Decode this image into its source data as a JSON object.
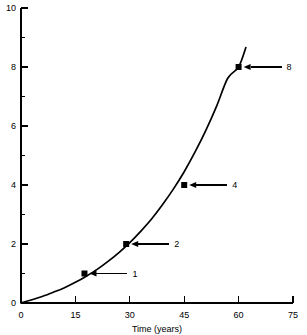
{
  "chart_data": {
    "type": "line",
    "title": "",
    "subtitle": "",
    "xlabel": "Time (years)",
    "ylabel": "",
    "xlim": [
      0,
      75
    ],
    "ylim": [
      0,
      10
    ],
    "grid": false,
    "legend": null,
    "x_ticks": [
      0,
      15,
      30,
      45,
      60,
      75
    ],
    "x_tick_labels": [
      "0",
      "15",
      "30",
      "45",
      "60",
      "75"
    ],
    "x_minor_ticks": [],
    "y_ticks": [
      0,
      2,
      4,
      6,
      8,
      10
    ],
    "y_tick_labels": [
      "0",
      "2",
      "4",
      "6",
      "8",
      "10"
    ],
    "y_minor_ticks": [
      1,
      3,
      5,
      7,
      9
    ],
    "series": [
      {
        "name": "exponential growth",
        "x": [
          0,
          3,
          6,
          9,
          12,
          15,
          18,
          21,
          24,
          27,
          30,
          33,
          36,
          39,
          42,
          45,
          48,
          51,
          54,
          57,
          60,
          62
        ],
        "y": [
          0.0,
          0.11,
          0.23,
          0.37,
          0.52,
          0.7,
          0.91,
          1.14,
          1.41,
          1.71,
          2.05,
          2.43,
          2.85,
          3.33,
          3.86,
          4.45,
          5.12,
          5.86,
          6.69,
          7.62,
          8.0,
          8.66
        ]
      }
    ],
    "annotations": [
      {
        "label": "1",
        "x": 17.5,
        "y": 1.0
      },
      {
        "label": "2",
        "x": 29.0,
        "y": 2.0
      },
      {
        "label": "4",
        "x": 45.0,
        "y": 4.0
      },
      {
        "label": "8",
        "x": 60.0,
        "y": 8.0
      }
    ],
    "colors": {
      "curve": "#000000",
      "axis": "#000000",
      "text": "#000000",
      "background": "#ffffff"
    }
  }
}
